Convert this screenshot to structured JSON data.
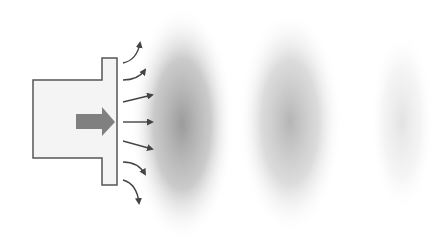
{
  "diagram": {
    "title": "",
    "colors": {
      "background": "#ffffff",
      "outline": "#555555",
      "source_fill": "#f4f4f4",
      "piston_arrow": "#808080",
      "radiating_arrows": "#444444",
      "wavefront": "#8a8a8a"
    },
    "source": {
      "label": "",
      "icon": "speaker-body-icon",
      "piston_arrow_icon": "arrow-right-icon"
    },
    "radiating_arrows": [
      {
        "direction": "up-curve"
      },
      {
        "direction": "slight-up-curve"
      },
      {
        "direction": "up-right"
      },
      {
        "direction": "right"
      },
      {
        "direction": "down-right"
      },
      {
        "direction": "slight-down-curve"
      },
      {
        "direction": "down-curve"
      }
    ],
    "wavefronts": [
      {
        "index": 1,
        "intensity": "strong"
      },
      {
        "index": 2,
        "intensity": "medium"
      },
      {
        "index": 3,
        "intensity": "faint"
      }
    ]
  }
}
